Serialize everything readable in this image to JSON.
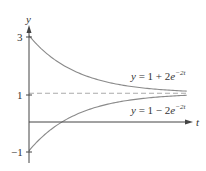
{
  "chart_data": {
    "type": "line",
    "title": "",
    "xlabel": "t",
    "ylabel": "y",
    "y_ticks": [
      {
        "value": 3,
        "label": "3"
      },
      {
        "value": 1,
        "label": "1"
      },
      {
        "value": -1,
        "label": "−1"
      }
    ],
    "xlim": [
      0,
      1.68
    ],
    "ylim": [
      -1.1,
      3.3
    ],
    "grid": false,
    "legend": "none",
    "series": [
      {
        "name": "y = 1 + 2e^{-2t}",
        "label_text": "y = 1 + 2e",
        "label_exp": "−2t",
        "formula": "1+2*exp(-2t)",
        "style": "solid",
        "color": "#8a8a8a",
        "points": [
          [
            0,
            3
          ],
          [
            0.25,
            2.21
          ],
          [
            0.5,
            1.74
          ],
          [
            0.75,
            1.45
          ],
          [
            1.0,
            1.27
          ],
          [
            1.25,
            1.16
          ],
          [
            1.5,
            1.1
          ],
          [
            1.66,
            1.07
          ]
        ]
      },
      {
        "name": "y = 1 - 2e^{-2t}",
        "label_text": "y = 1 − 2e",
        "label_exp": "−2t",
        "formula": "1-2*exp(-2t)",
        "style": "solid",
        "color": "#8a8a8a",
        "points": [
          [
            0,
            -1
          ],
          [
            0.25,
            -0.21
          ],
          [
            0.347,
            0
          ],
          [
            0.5,
            0.26
          ],
          [
            0.75,
            0.55
          ],
          [
            1.0,
            0.73
          ],
          [
            1.25,
            0.84
          ],
          [
            1.5,
            0.9
          ],
          [
            1.66,
            0.93
          ]
        ]
      },
      {
        "name": "y = 1",
        "formula": "1",
        "style": "dashed",
        "color": "#aaaaaa",
        "points": [
          [
            0,
            1
          ],
          [
            1.66,
            1
          ]
        ]
      }
    ]
  },
  "colors": {
    "axis": "#444444",
    "curve": "#8a8a8a",
    "dashed": "#aaaaaa",
    "text": "#333333"
  }
}
